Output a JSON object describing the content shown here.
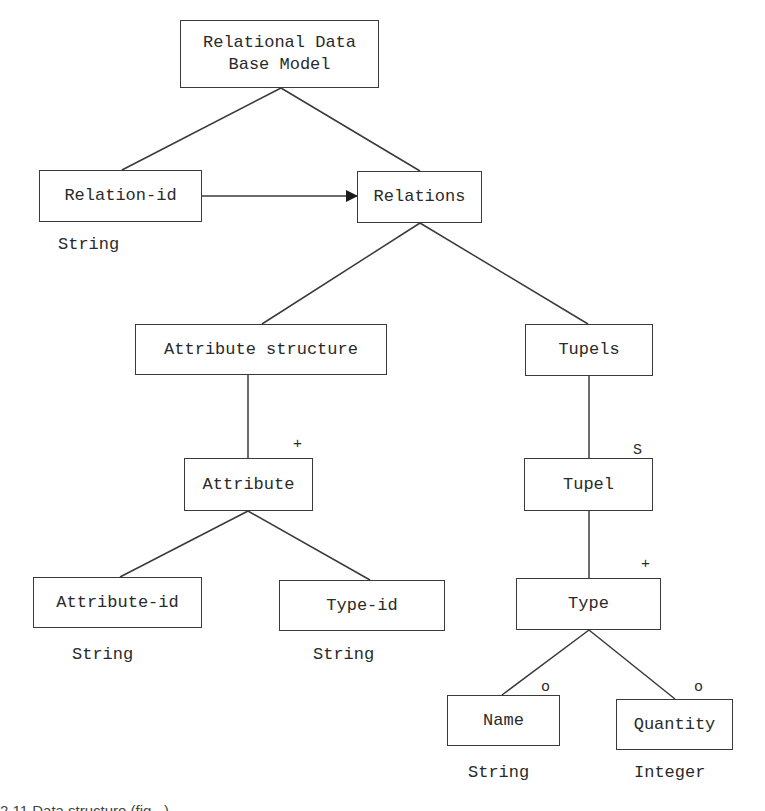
{
  "diagram": {
    "type": "jackson-structure-tree",
    "nodes": {
      "root": {
        "label": "Relational Data\nBase Model"
      },
      "relation_id": {
        "label": "Relation-id",
        "type_label": "String"
      },
      "relations": {
        "label": "Relations"
      },
      "attribute_structure": {
        "label": "Attribute structure"
      },
      "tupels": {
        "label": "Tupels"
      },
      "attribute": {
        "label": "Attribute",
        "marker": "+"
      },
      "tupel": {
        "label": "Tupel",
        "marker": "S"
      },
      "type": {
        "label": "Type",
        "marker": "+"
      },
      "attribute_id": {
        "label": "Attribute-id",
        "type_label": "String"
      },
      "type_id": {
        "label": "Type-id",
        "type_label": "String"
      },
      "name": {
        "label": "Name",
        "marker": "o",
        "type_label": "String"
      },
      "quantity": {
        "label": "Quantity",
        "marker": "o",
        "type_label": "Integer"
      }
    },
    "edges": [
      {
        "from": "root",
        "to": "relation_id",
        "style": "line"
      },
      {
        "from": "root",
        "to": "relations",
        "style": "line"
      },
      {
        "from": "relation_id",
        "to": "relations",
        "style": "arrow"
      },
      {
        "from": "relations",
        "to": "attribute_structure",
        "style": "line"
      },
      {
        "from": "relations",
        "to": "tupels",
        "style": "line"
      },
      {
        "from": "attribute_structure",
        "to": "attribute",
        "style": "line"
      },
      {
        "from": "tupels",
        "to": "tupel",
        "style": "line"
      },
      {
        "from": "tupel",
        "to": "type",
        "style": "line"
      },
      {
        "from": "attribute",
        "to": "attribute_id",
        "style": "line"
      },
      {
        "from": "attribute",
        "to": "type_id",
        "style": "line"
      },
      {
        "from": "type",
        "to": "name",
        "style": "line"
      },
      {
        "from": "type",
        "to": "quantity",
        "style": "line"
      }
    ]
  },
  "caption": {
    "text": "2.11  Data structure (fig...) ..."
  }
}
